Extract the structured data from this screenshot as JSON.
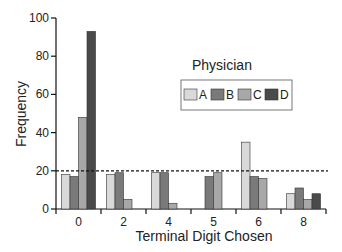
{
  "chart_data": {
    "type": "bar",
    "title": "",
    "xlabel": "Terminal Digit Chosen",
    "ylabel": "Frequency",
    "ylim": [
      0,
      100
    ],
    "yticks": [
      0,
      20,
      40,
      60,
      80,
      100
    ],
    "categories": [
      "0",
      "2",
      "4",
      "5",
      "6",
      "8"
    ],
    "series": [
      {
        "name": "A",
        "color": "#d9d9d9",
        "values": [
          18,
          18,
          19,
          0,
          35,
          8
        ]
      },
      {
        "name": "B",
        "color": "#7a7a7a",
        "values": [
          17,
          19,
          19,
          17,
          17,
          11
        ]
      },
      {
        "name": "C",
        "color": "#a8a8a8",
        "values": [
          48,
          5,
          3,
          19,
          16,
          5
        ]
      },
      {
        "name": "D",
        "color": "#4a4a4a",
        "values": [
          93,
          0,
          0,
          0,
          0,
          8
        ]
      }
    ],
    "reference_line": {
      "value": 20,
      "style": "dashed"
    },
    "legend": {
      "title": "Physician",
      "position": "upper right",
      "entries": [
        "A",
        "B",
        "C",
        "D"
      ]
    },
    "grid": false
  }
}
